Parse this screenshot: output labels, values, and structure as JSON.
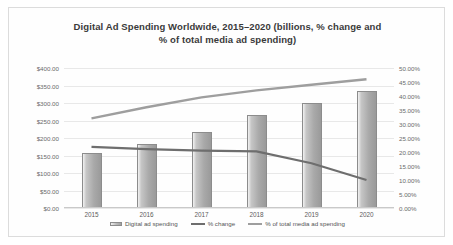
{
  "chart_data": {
    "type": "bar",
    "title": "Digital Ad Spending Worldwide, 2015–2020 (billions, % change and % of total media ad spending)",
    "title_line1": "Digital Ad Spending Worldwide, 2015–2020 (billions, % change and",
    "title_line2": "% of total media ad spending)",
    "categories": [
      "2015",
      "2016",
      "2017",
      "2018",
      "2019",
      "2020"
    ],
    "xlabel": "",
    "ylabel": "",
    "ylim": [
      0,
      400
    ],
    "y_ticks": [
      "$0.00",
      "$50.00",
      "$100.00",
      "$150.00",
      "$200.00",
      "$250.00",
      "$300.00",
      "$350.00",
      "$400.00"
    ],
    "y_tick_values": [
      0,
      50,
      100,
      150,
      200,
      250,
      300,
      350,
      400
    ],
    "y2lim": [
      0,
      50
    ],
    "y2_ticks": [
      "0.00%",
      "5.00%",
      "10.00%",
      "15.00%",
      "20.00%",
      "25.00%",
      "30.00%",
      "35.00%",
      "40.00%",
      "45.00%",
      "50.00%"
    ],
    "y2_tick_values": [
      0,
      5,
      10,
      15,
      20,
      25,
      30,
      35,
      40,
      45,
      50
    ],
    "grid": true,
    "legend_position": "bottom",
    "series": [
      {
        "name": "Digital ad spending",
        "type": "bar",
        "axis": "left",
        "values": [
          157,
          183,
          217,
          266,
          300,
          334
        ],
        "color": "#a9a9a9"
      },
      {
        "name": "% change",
        "type": "line",
        "axis": "right",
        "values": [
          21.8,
          21.0,
          20.5,
          20.2,
          16.0,
          10.0
        ],
        "color": "#6e6e6e"
      },
      {
        "name": "% of total media ad spending",
        "type": "line",
        "axis": "right",
        "values": [
          32.0,
          36.0,
          39.5,
          42.0,
          44.0,
          46.0
        ],
        "color": "#9e9e9e"
      }
    ]
  }
}
